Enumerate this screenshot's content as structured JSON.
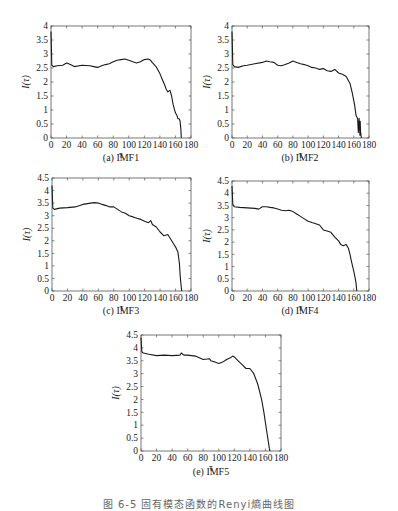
{
  "figure_caption": "图 6-5  固有模态函数的Renyi熵曲线图",
  "chart_data": [
    {
      "type": "line",
      "title": "(a) IMF1",
      "xlabel": "τ",
      "ylabel": "I(τ)",
      "xlim": [
        0,
        180
      ],
      "ylim": [
        0,
        4
      ],
      "xticks": [
        0,
        20,
        40,
        60,
        80,
        100,
        120,
        140,
        160,
        180
      ],
      "yticks": [
        0,
        0.5,
        1,
        1.5,
        2,
        2.5,
        3,
        3.5,
        4
      ],
      "grid": false,
      "x": [
        0,
        1,
        3,
        8,
        15,
        20,
        25,
        30,
        40,
        50,
        55,
        60,
        65,
        70,
        75,
        80,
        85,
        90,
        95,
        100,
        105,
        110,
        115,
        120,
        125,
        128,
        130,
        135,
        140,
        143,
        146,
        148,
        150,
        153,
        155,
        157,
        160,
        162,
        163,
        165,
        166,
        167,
        167.5
      ],
      "values": [
        3.8,
        2.6,
        2.55,
        2.58,
        2.6,
        2.68,
        2.62,
        2.55,
        2.6,
        2.58,
        2.55,
        2.52,
        2.58,
        2.62,
        2.65,
        2.72,
        2.78,
        2.8,
        2.82,
        2.78,
        2.72,
        2.68,
        2.72,
        2.8,
        2.82,
        2.78,
        2.7,
        2.55,
        2.3,
        2.1,
        1.9,
        1.75,
        1.65,
        1.7,
        1.5,
        1.2,
        0.9,
        0.8,
        0.7,
        0.68,
        0.6,
        0.3,
        0
      ]
    },
    {
      "type": "line",
      "title": "(b) IMF2",
      "xlabel": "τ",
      "ylabel": "I(τ)",
      "xlim": [
        0,
        180
      ],
      "ylim": [
        0,
        4
      ],
      "xticks": [
        0,
        20,
        40,
        60,
        80,
        100,
        120,
        140,
        160,
        180
      ],
      "yticks": [
        0,
        0.5,
        1,
        1.5,
        2,
        2.5,
        3,
        3.5,
        4
      ],
      "grid": false,
      "x": [
        0,
        1,
        3,
        8,
        15,
        20,
        30,
        40,
        45,
        50,
        55,
        60,
        65,
        70,
        75,
        80,
        85,
        90,
        95,
        100,
        105,
        110,
        115,
        120,
        125,
        130,
        135,
        140,
        145,
        150,
        155,
        158,
        161,
        163,
        165,
        166,
        167,
        168,
        168.5,
        169,
        170
      ],
      "values": [
        3.8,
        2.62,
        2.55,
        2.52,
        2.58,
        2.6,
        2.65,
        2.7,
        2.75,
        2.72,
        2.7,
        2.6,
        2.58,
        2.62,
        2.68,
        2.75,
        2.7,
        2.65,
        2.62,
        2.58,
        2.52,
        2.5,
        2.45,
        2.48,
        2.4,
        2.38,
        2.45,
        2.32,
        2.28,
        2.2,
        1.95,
        1.6,
        1.2,
        0.8,
        0.7,
        0.2,
        0.7,
        0.1,
        0.6,
        0.2,
        0
      ]
    },
    {
      "type": "line",
      "title": "(c) IMF3",
      "xlabel": "τ",
      "ylabel": "I(τ)",
      "xlim": [
        0,
        180
      ],
      "ylim": [
        0,
        4.5
      ],
      "xticks": [
        0,
        20,
        40,
        60,
        80,
        100,
        120,
        140,
        160,
        180
      ],
      "yticks": [
        0,
        0.5,
        1,
        1.5,
        2,
        2.5,
        3,
        3.5,
        4,
        4.5
      ],
      "grid": false,
      "x": [
        0,
        1,
        3,
        10,
        20,
        30,
        40,
        50,
        55,
        60,
        65,
        70,
        75,
        80,
        85,
        90,
        95,
        100,
        105,
        110,
        115,
        120,
        125,
        128,
        130,
        135,
        140,
        145,
        150,
        155,
        158,
        160,
        163,
        165,
        166,
        167,
        168
      ],
      "values": [
        4.2,
        3.3,
        3.25,
        3.3,
        3.32,
        3.35,
        3.45,
        3.5,
        3.52,
        3.5,
        3.45,
        3.4,
        3.35,
        3.35,
        3.25,
        3.15,
        3.1,
        3.0,
        2.95,
        2.9,
        2.85,
        2.78,
        2.72,
        2.8,
        2.65,
        2.55,
        2.35,
        2.2,
        2.25,
        2.0,
        1.85,
        1.75,
        1.55,
        1.1,
        0.6,
        0.25,
        0
      ]
    },
    {
      "type": "line",
      "title": "(d) IMF4",
      "xlabel": "τ",
      "ylabel": "I(τ)",
      "xlim": [
        0,
        180
      ],
      "ylim": [
        0,
        4.5
      ],
      "xticks": [
        0,
        20,
        40,
        60,
        80,
        100,
        120,
        140,
        160,
        180
      ],
      "yticks": [
        0,
        0.5,
        1,
        1.5,
        2,
        2.5,
        3,
        3.5,
        4,
        4.5
      ],
      "grid": false,
      "x": [
        0,
        1,
        3,
        10,
        20,
        30,
        35,
        40,
        45,
        50,
        55,
        60,
        65,
        70,
        75,
        80,
        85,
        90,
        95,
        100,
        105,
        110,
        115,
        120,
        125,
        130,
        135,
        140,
        143,
        146,
        150,
        153,
        155,
        157,
        160,
        162,
        163,
        164
      ],
      "values": [
        4.3,
        3.55,
        3.45,
        3.42,
        3.4,
        3.38,
        3.35,
        3.45,
        3.45,
        3.42,
        3.4,
        3.35,
        3.3,
        3.28,
        3.3,
        3.25,
        3.15,
        3.05,
        2.95,
        2.85,
        2.8,
        2.75,
        2.7,
        2.5,
        2.45,
        2.4,
        2.2,
        2.05,
        1.9,
        1.85,
        1.9,
        1.75,
        1.5,
        1.2,
        0.8,
        0.5,
        0.3,
        0
      ]
    },
    {
      "type": "line",
      "title": "(e) IMF5",
      "xlabel": "τ",
      "ylabel": "I(τ)",
      "xlim": [
        0,
        180
      ],
      "ylim": [
        0,
        4.5
      ],
      "xticks": [
        0,
        20,
        40,
        60,
        80,
        100,
        120,
        140,
        160,
        180
      ],
      "yticks": [
        0,
        0.5,
        1,
        1.5,
        2,
        2.5,
        3,
        3.5,
        4,
        4.5
      ],
      "grid": false,
      "x": [
        0,
        1,
        3,
        10,
        20,
        30,
        40,
        50,
        52,
        55,
        60,
        70,
        80,
        88,
        90,
        95,
        100,
        105,
        110,
        115,
        118,
        120,
        125,
        130,
        135,
        140,
        145,
        150,
        155,
        158,
        160,
        162,
        164,
        165,
        166
      ],
      "values": [
        4.4,
        3.85,
        3.8,
        3.75,
        3.7,
        3.72,
        3.7,
        3.72,
        3.8,
        3.72,
        3.72,
        3.68,
        3.55,
        3.58,
        3.5,
        3.45,
        3.4,
        3.45,
        3.55,
        3.62,
        3.68,
        3.65,
        3.5,
        3.35,
        3.2,
        3.2,
        3.0,
        2.6,
        2.0,
        1.5,
        1.1,
        0.7,
        0.3,
        0.1,
        0
      ]
    }
  ],
  "panels": [
    {
      "caption": "(a) IMF1",
      "ylabel": "I(τ)",
      "xlabel": "τ"
    },
    {
      "caption": "(b) IMF2",
      "ylabel": "I(τ)",
      "xlabel": "τ"
    },
    {
      "caption": "(c) IMF3",
      "ylabel": "I(τ)",
      "xlabel": "τ"
    },
    {
      "caption": "(d) IMF4",
      "ylabel": "I(τ)",
      "xlabel": "τ"
    },
    {
      "caption": "(e) IMF5",
      "ylabel": "I(τ)",
      "xlabel": "τ"
    }
  ],
  "colors": {
    "line": "#1a1a1a",
    "axis": "#555555",
    "text": "#222222"
  }
}
